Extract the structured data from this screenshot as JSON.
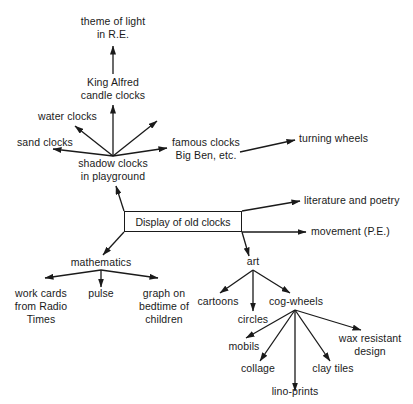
{
  "diagram": {
    "type": "topic web / mind map",
    "center": {
      "label": "Display of old clocks"
    },
    "branches": {
      "shadow_clocks": {
        "lines": [
          "shadow clocks",
          "in playground"
        ],
        "children": {
          "sand_clocks": {
            "lines": [
              "sand clocks"
            ]
          },
          "water_clocks": {
            "lines": [
              "water clocks"
            ]
          },
          "king_alfred": {
            "lines": [
              "King Alfred",
              "candle clocks"
            ],
            "children": {
              "theme_of_light": {
                "lines": [
                  "theme of light",
                  "in R.E."
                ]
              }
            }
          },
          "famous_clocks": {
            "lines": [
              "famous clocks",
              "Big Ben, etc."
            ],
            "children": {
              "turning_wheels": {
                "lines": [
                  "turning wheels"
                ]
              }
            }
          }
        }
      },
      "literature": {
        "lines": [
          "literature and poetry"
        ]
      },
      "movement": {
        "lines": [
          "movement (P.E.)"
        ]
      },
      "mathematics": {
        "lines": [
          "mathematics"
        ],
        "children": {
          "work_cards": {
            "lines": [
              "work cards",
              "from Radio",
              "Times"
            ]
          },
          "pulse": {
            "lines": [
              "pulse"
            ]
          },
          "graph": {
            "lines": [
              "graph on",
              "bedtime of",
              "children"
            ]
          }
        }
      },
      "art": {
        "lines": [
          "art"
        ],
        "children": {
          "cartoons": {
            "lines": [
              "cartoons"
            ]
          },
          "circles": {
            "lines": [
              "circles"
            ]
          },
          "cog_wheels": {
            "lines": [
              "cog-wheels"
            ],
            "children": {
              "mobils": {
                "lines": [
                  "mobils"
                ]
              },
              "collage": {
                "lines": [
                  "collage"
                ]
              },
              "lino_prints": {
                "lines": [
                  "lino-prints"
                ]
              },
              "clay_tiles": {
                "lines": [
                  "clay tiles"
                ]
              },
              "wax_resistant": {
                "lines": [
                  "wax resistant",
                  "design"
                ]
              }
            }
          }
        }
      }
    },
    "colors": {
      "ink": "#1a1a1a",
      "background": "#ffffff"
    }
  }
}
